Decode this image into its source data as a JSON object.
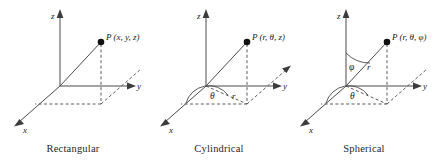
{
  "figure": {
    "panel_count": 3
  },
  "panels": [
    {
      "id": "rectangular",
      "caption": "Rectangular",
      "point_label": "P (x, y, z)",
      "axes": [
        {
          "name": "z",
          "label": "z",
          "direction": "up"
        },
        {
          "name": "y",
          "label": "y",
          "direction": "right"
        },
        {
          "name": "x",
          "label": "x",
          "direction": "down-left"
        }
      ],
      "angle_labels": [],
      "radial_labels": []
    },
    {
      "id": "cylindrical",
      "caption": "Cylindrical",
      "point_label": "P (r, θ, z)",
      "axes": [
        {
          "name": "z",
          "label": "z",
          "direction": "up"
        },
        {
          "name": "y",
          "label": "y",
          "direction": "right"
        },
        {
          "name": "x",
          "label": "x",
          "direction": "down-left"
        }
      ],
      "angle_labels": [
        {
          "name": "theta",
          "label": "θ"
        }
      ],
      "radial_labels": [
        {
          "name": "r",
          "label": "r"
        }
      ]
    },
    {
      "id": "spherical",
      "caption": "Spherical",
      "point_label": "P (r, θ, φ)",
      "axes": [
        {
          "name": "z",
          "label": "z",
          "direction": "up"
        },
        {
          "name": "y",
          "label": "y",
          "direction": "right"
        },
        {
          "name": "x",
          "label": "x",
          "direction": "down-left"
        }
      ],
      "angle_labels": [
        {
          "name": "phi",
          "label": "φ"
        },
        {
          "name": "theta",
          "label": "θ"
        }
      ],
      "radial_labels": [
        {
          "name": "r",
          "label": "r"
        }
      ]
    }
  ],
  "colors": {
    "line": "#4a4a4a",
    "dashed": "#5a5a5a",
    "point": "#111111",
    "text": "#1a1a1a",
    "background": "#ffffff"
  }
}
